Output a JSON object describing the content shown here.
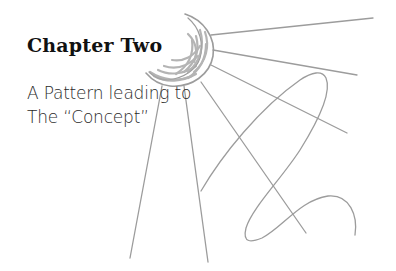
{
  "heading": {
    "title": "Chapter Two",
    "subtitle_line1": "A Pattern leading to",
    "subtitle_line2": "The “Concept”"
  },
  "illustration": {
    "description": "pencil sketch of a crescent sun with rays and a looping line",
    "stroke_color": "#9a9a9a"
  }
}
